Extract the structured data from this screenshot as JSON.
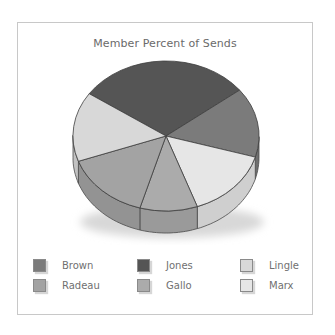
{
  "chart_data": {
    "type": "pie",
    "title": "Member Percent of Sends",
    "style": "3d-tilted",
    "categories": [
      "Jones",
      "Brown",
      "Marx",
      "Gallo",
      "Radeau",
      "Lingle"
    ],
    "values": [
      30,
      15,
      15,
      10,
      15,
      15
    ],
    "unit": "%",
    "colors": [
      "#555555",
      "#7b7b7b",
      "#e6e6e6",
      "#ababab",
      "#a3a3a3",
      "#d8d8d8"
    ],
    "legend_position": "bottom",
    "legend": [
      {
        "label": "Brown",
        "color": "#7b7b7b"
      },
      {
        "label": "Jones",
        "color": "#555555"
      },
      {
        "label": "Lingle",
        "color": "#d8d8d8"
      },
      {
        "label": "Radeau",
        "color": "#a3a3a3"
      },
      {
        "label": "Gallo",
        "color": "#ababab"
      },
      {
        "label": "Marx",
        "color": "#e6e6e6"
      }
    ]
  }
}
